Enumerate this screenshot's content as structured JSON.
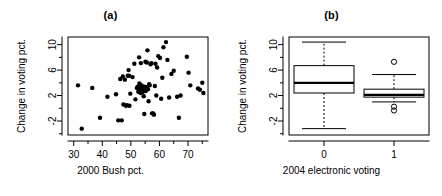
{
  "figure": {
    "panels": [
      {
        "tag": "(a)",
        "xlabel": "2000 Bush pct.",
        "ylabel": "Change in voting pct."
      },
      {
        "tag": "(b)",
        "xlabel": "2004 electronic voting",
        "ylabel": "Change in voting pct."
      }
    ]
  },
  "chart_data": [
    {
      "type": "scatter",
      "title": "(a)",
      "xlabel": "2000 Bush pct.",
      "ylabel": "Change in voting pct.",
      "xlim": [
        28,
        77
      ],
      "ylim": [
        -4.2,
        11.2
      ],
      "xticks": [
        30,
        40,
        50,
        60,
        70
      ],
      "xtick_labels": [
        "30",
        "40",
        "50",
        "60",
        "70"
      ],
      "yticks": [
        -2,
        2,
        6,
        10
      ],
      "ytick_labels": [
        "-2",
        "2",
        "6",
        "10"
      ],
      "xminor": [
        35,
        45,
        55,
        65,
        75
      ],
      "yminor": [
        -4,
        0,
        4,
        8
      ],
      "grid": false,
      "legend": "none",
      "marker": "filled-circle",
      "points": [
        [
          31.5,
          3.6
        ],
        [
          32.8,
          -3.2
        ],
        [
          36.5,
          3.2
        ],
        [
          39.2,
          -1.5
        ],
        [
          41.8,
          1.8
        ],
        [
          44.8,
          2.2
        ],
        [
          45.6,
          -1.9
        ],
        [
          46.3,
          4.6
        ],
        [
          46.8,
          -1.9
        ],
        [
          47.2,
          5.0
        ],
        [
          47.4,
          0.6
        ],
        [
          47.9,
          4.5
        ],
        [
          48.3,
          0.4
        ],
        [
          48.6,
          0.5
        ],
        [
          48.9,
          5.1
        ],
        [
          49.2,
          6.0
        ],
        [
          49.4,
          5.1
        ],
        [
          49.5,
          0.4
        ],
        [
          49.8,
          2.3
        ],
        [
          50.6,
          4.9
        ],
        [
          51.2,
          7.0
        ],
        [
          51.6,
          1.4
        ],
        [
          52.1,
          3.2
        ],
        [
          52.4,
          3.4
        ],
        [
          52.6,
          2.6
        ],
        [
          52.9,
          8.0
        ],
        [
          53.0,
          3.9
        ],
        [
          53.2,
          3.0
        ],
        [
          53.4,
          2.4
        ],
        [
          53.5,
          7.1
        ],
        [
          53.6,
          3.5
        ],
        [
          53.8,
          3.6
        ],
        [
          53.9,
          2.9
        ],
        [
          54.1,
          3.2
        ],
        [
          54.2,
          2.6
        ],
        [
          54.4,
          3.1
        ],
        [
          54.5,
          1.9
        ],
        [
          54.7,
          -0.9
        ],
        [
          54.9,
          3.4
        ],
        [
          55.1,
          7.3
        ],
        [
          55.2,
          2.7
        ],
        [
          55.4,
          3.3
        ],
        [
          55.6,
          7.2
        ],
        [
          55.8,
          9.1
        ],
        [
          56.0,
          3.0
        ],
        [
          56.2,
          1.1
        ],
        [
          56.4,
          3.8
        ],
        [
          56.6,
          3.6
        ],
        [
          56.9,
          6.9
        ],
        [
          57.2,
          7.1
        ],
        [
          57.4,
          -0.8
        ],
        [
          57.8,
          -0.8
        ],
        [
          58.1,
          -1.0
        ],
        [
          58.4,
          3.5
        ],
        [
          58.6,
          7.0
        ],
        [
          58.9,
          2.0
        ],
        [
          59.2,
          6.4
        ],
        [
          59.6,
          8.2
        ],
        [
          60.2,
          7.9
        ],
        [
          60.6,
          1.5
        ],
        [
          61.0,
          4.8
        ],
        [
          61.4,
          9.6
        ],
        [
          62.3,
          10.4
        ],
        [
          62.8,
          7.6
        ],
        [
          63.4,
          1.7
        ],
        [
          64.2,
          5.4
        ],
        [
          65.0,
          5.9
        ],
        [
          66.2,
          1.8
        ],
        [
          66.8,
          -1.5
        ],
        [
          67.4,
          2.0
        ],
        [
          69.6,
          8.1
        ],
        [
          70.2,
          5.6
        ],
        [
          70.8,
          3.6
        ],
        [
          73.5,
          3.1
        ],
        [
          74.2,
          2.9
        ],
        [
          75.0,
          4.0
        ],
        [
          75.4,
          2.4
        ]
      ]
    },
    {
      "type": "boxplot",
      "title": "(b)",
      "xlabel": "2004 electronic voting",
      "ylabel": "Change in voting pct.",
      "ylim": [
        -4.2,
        11.2
      ],
      "yticks": [
        -2,
        2,
        6,
        10
      ],
      "ytick_labels": [
        "-2",
        "2",
        "6",
        "10"
      ],
      "yminor": [
        -4,
        0,
        4,
        8
      ],
      "categories": [
        "0",
        "1"
      ],
      "grid": false,
      "legend": "none",
      "boxes": [
        {
          "category": "0",
          "whisker_low": -3.2,
          "q1": 2.4,
          "median": 4.0,
          "q3": 6.7,
          "whisker_high": 10.4,
          "outliers": []
        },
        {
          "category": "1",
          "whisker_low": 1.0,
          "q1": 1.75,
          "median": 2.1,
          "q3": 3.0,
          "whisker_high": 5.3,
          "outliers": [
            7.3,
            0.25,
            -0.35
          ]
        }
      ]
    }
  ]
}
